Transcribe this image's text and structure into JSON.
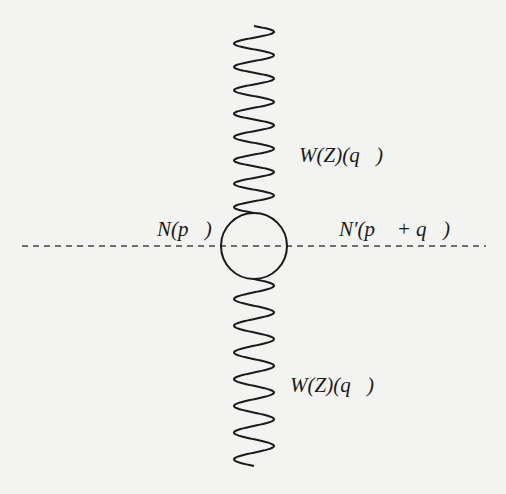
{
  "diagram": {
    "type": "feynman-diagram",
    "labels": {
      "top_boson": "W(Z)(q⃗)",
      "incoming_nucleon": "N(p⃗)",
      "outgoing_nucleon": "N′(p⃗ + q⃗)",
      "bottom_boson": "W(Z)(q⃗)"
    },
    "elements": {
      "top_wavy_line": {
        "x_center": 254,
        "y_start": 26,
        "y_end": 213,
        "periods": 8,
        "amplitude": 20
      },
      "loop": {
        "cx": 254,
        "cy": 246,
        "r": 33
      },
      "dashed_line": {
        "x_start": 22,
        "x_end": 486,
        "y": 246
      },
      "bottom_wavy_line": {
        "x_center": 254,
        "y_start": 279,
        "y_end": 466,
        "periods": 7,
        "amplitude": 20
      }
    },
    "colors": {
      "stroke": "#1a1a1a",
      "dashed": "#444444",
      "background": "#f3f3f1"
    }
  }
}
